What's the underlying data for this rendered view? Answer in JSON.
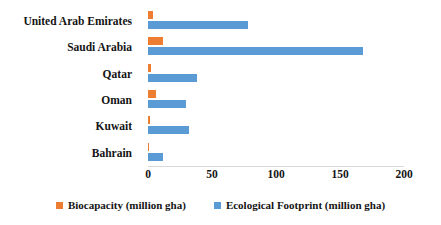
{
  "chart_data": {
    "type": "bar",
    "orientation": "horizontal",
    "title": "",
    "xlabel": "",
    "ylabel": "",
    "xlim": [
      0,
      200
    ],
    "xticks": [
      0,
      50,
      100,
      150,
      200
    ],
    "xtick_labels": [
      "0",
      "50",
      "100",
      "150",
      "200"
    ],
    "grid": false,
    "legend_position": "bottom",
    "categories": [
      "United Arab Emirates",
      "Saudi Arabia",
      "Qatar",
      "Oman",
      "Kuwait",
      "Bahrain"
    ],
    "series": [
      {
        "name": "Biocapacity (million gha)",
        "color": "#ED7D31",
        "values": [
          4,
          12,
          2,
          6,
          1.5,
          0.5
        ]
      },
      {
        "name": "Ecological Footprint (million gha)",
        "color": "#5B9BD5",
        "values": [
          78,
          168,
          38,
          30,
          32,
          12
        ]
      }
    ]
  },
  "legend": {
    "items": [
      {
        "label": "Biocapacity (million gha)",
        "color": "#ED7D31"
      },
      {
        "label": "Ecological Footprint (million gha)",
        "color": "#5B9BD5"
      }
    ]
  }
}
